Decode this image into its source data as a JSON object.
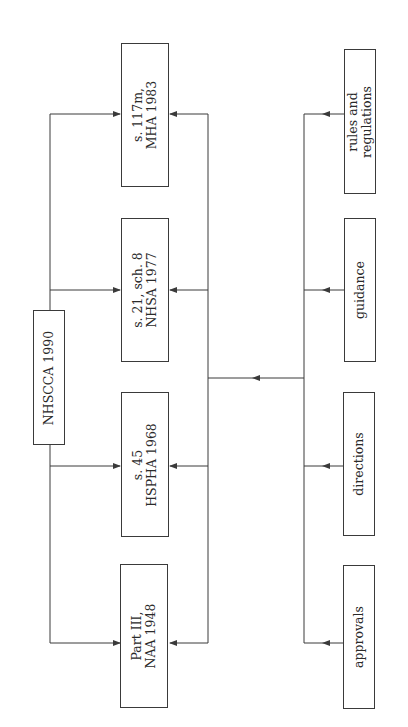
{
  "diagram": {
    "orientation": "rotated -90deg",
    "root": {
      "id": "nhscca",
      "label": "NHSCCA 1990"
    },
    "statutes": [
      {
        "id": "mha",
        "line1": "s. 117m,",
        "line2": "MHA 1983"
      },
      {
        "id": "nhsa",
        "line1": "s. 21, sch. 8",
        "line2": "NHSA 1977"
      },
      {
        "id": "hspha",
        "line1": "s. 45",
        "line2": "HSPHA 1968"
      },
      {
        "id": "naa",
        "line1": "Part III,",
        "line2": "NAA 1948"
      }
    ],
    "instruments": [
      {
        "id": "rules",
        "line1": "rules and",
        "line2": "regulations"
      },
      {
        "id": "guidance",
        "line1": "guidance",
        "line2": ""
      },
      {
        "id": "directions",
        "line1": "directions",
        "line2": ""
      },
      {
        "id": "approvals",
        "line1": "approvals",
        "line2": ""
      }
    ],
    "edges": [
      {
        "from": "NHSCCA 1990",
        "to": "s. 117m, MHA 1983"
      },
      {
        "from": "NHSCCA 1990",
        "to": "s. 21, sch. 8 NHSA 1977"
      },
      {
        "from": "NHSCCA 1990",
        "to": "s. 45 HSPHA 1968"
      },
      {
        "from": "NHSCCA 1990",
        "to": "Part III, NAA 1948"
      },
      {
        "from": "rules and regulations",
        "to": "statutes (all four)"
      },
      {
        "from": "guidance",
        "to": "statutes (all four)"
      },
      {
        "from": "directions",
        "to": "statutes (all four)"
      },
      {
        "from": "approvals",
        "to": "statutes (all four)"
      }
    ],
    "colors": {
      "line": "#3a3a3a",
      "text": "#2a2a2a",
      "background": "#ffffff"
    }
  }
}
